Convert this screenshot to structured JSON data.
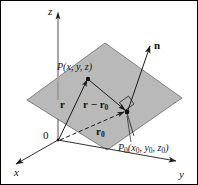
{
  "figure": {
    "canvas": {
      "width": 198,
      "height": 185
    },
    "colors": {
      "plane_fill": "#b8b8b8",
      "plane_stroke": "#4a4a4a",
      "line": "#1a1a1a",
      "axis": "#9a9a9a",
      "background": "#ffffff",
      "frame": "#000000"
    }
  },
  "axes": {
    "x_label": "x",
    "y_label": "y",
    "z_label": "z",
    "origin_label": "0"
  },
  "points": {
    "p": {
      "name": "P",
      "coords_open": "(",
      "coords": "x, y, z",
      "coords_close": ")",
      "full_label": "P(x, y, z)"
    },
    "p0": {
      "name": "P",
      "subscript": "0",
      "full_label": "P0(x0, y0, z0)",
      "coord_x": "x",
      "coord_x_sub": "0",
      "coord_y": "y",
      "coord_y_sub": "0",
      "coord_z": "z",
      "coord_z_sub": "0"
    }
  },
  "vectors": {
    "r": {
      "label": "r",
      "description": "position vector from origin to P"
    },
    "r_minus_r0": {
      "label_left": "r",
      "operator": "−",
      "label_right": "r",
      "subscript": "0",
      "full_label": "r − r0",
      "description": "vector from P0 to P lying in the plane"
    },
    "r0": {
      "label": "r",
      "subscript": "0",
      "full_label": "r0",
      "description": "position vector from origin to P0, drawn dashed"
    },
    "n": {
      "label": "n",
      "description": "normal vector to the plane at P0"
    }
  },
  "markers": {
    "right_angle": "right-angle-marker"
  }
}
